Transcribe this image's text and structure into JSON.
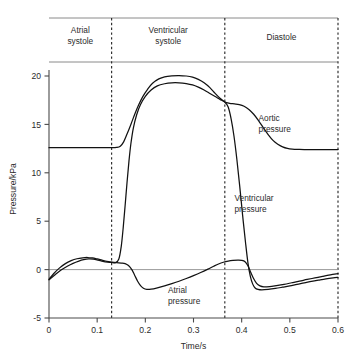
{
  "chart_data": {
    "type": "line",
    "title": "",
    "xlabel": "Time/s",
    "ylabel": "Pressure/kPa",
    "xlim": [
      0,
      0.6
    ],
    "ylim": [
      -5,
      20.5
    ],
    "grid": false,
    "legend_position": "inline-annotations",
    "x_ticks": [
      "0",
      "0.1",
      "0.2",
      "0.3",
      "0.4",
      "0.5",
      "0.6"
    ],
    "x_tick_values": [
      0,
      0.1,
      0.2,
      0.3,
      0.4,
      0.5,
      0.6
    ],
    "y_ticks": [
      "-5",
      "0",
      "5",
      "10",
      "15",
      "20"
    ],
    "y_tick_values": [
      -5,
      0,
      5,
      10,
      15,
      20
    ],
    "phases": [
      {
        "name": "atrial-systole",
        "label": "Atrial\nsystole",
        "label_line1": "Atrial",
        "label_line2": "systole",
        "t_start": 0.0,
        "t_end": 0.13
      },
      {
        "name": "ventricular-systole",
        "label": "Ventricular\nsystole",
        "label_line1": "Ventricular",
        "label_line2": "systole",
        "t_start": 0.13,
        "t_end": 0.365
      },
      {
        "name": "diastole",
        "label": "Diastole",
        "label_line1": "Diastole",
        "label_line2": "",
        "t_start": 0.365,
        "t_end": 0.6
      }
    ],
    "phase_dividers": [
      0.13,
      0.365,
      0.6
    ],
    "annotations": [
      {
        "name": "aortic-pressure-label",
        "line1": "Aortic",
        "line2": "pressure",
        "t": 0.435,
        "p": 15.4
      },
      {
        "name": "ventricular-pressure-label",
        "line1": "Ventricular",
        "line2": "pressure",
        "t": 0.385,
        "p": 7.1
      },
      {
        "name": "atrial-pressure-label",
        "line1": "Atrial",
        "line2": "pressure",
        "t": 0.247,
        "p": -2.4
      }
    ],
    "series": [
      {
        "name": "Aortic pressure",
        "key": "aortic",
        "baseline_kpa": 12.6,
        "peak_kpa": 20.0,
        "incisura_kpa": 17.3,
        "end_kpa": 12.4,
        "points": [
          [
            0.0,
            12.6
          ],
          [
            0.02,
            12.6
          ],
          [
            0.04,
            12.6
          ],
          [
            0.06,
            12.6
          ],
          [
            0.08,
            12.6
          ],
          [
            0.1,
            12.6
          ],
          [
            0.12,
            12.6
          ],
          [
            0.13,
            12.6
          ],
          [
            0.14,
            12.62
          ],
          [
            0.148,
            12.75
          ],
          [
            0.155,
            13.2
          ],
          [
            0.162,
            14.0
          ],
          [
            0.17,
            15.0
          ],
          [
            0.178,
            16.05
          ],
          [
            0.186,
            17.0
          ],
          [
            0.195,
            17.9
          ],
          [
            0.205,
            18.65
          ],
          [
            0.215,
            19.25
          ],
          [
            0.228,
            19.7
          ],
          [
            0.24,
            19.92
          ],
          [
            0.255,
            20.02
          ],
          [
            0.27,
            20.05
          ],
          [
            0.285,
            20.0
          ],
          [
            0.298,
            19.88
          ],
          [
            0.31,
            19.65
          ],
          [
            0.322,
            19.3
          ],
          [
            0.334,
            18.8
          ],
          [
            0.345,
            18.2
          ],
          [
            0.355,
            17.7
          ],
          [
            0.365,
            17.32
          ],
          [
            0.375,
            17.18
          ],
          [
            0.385,
            17.12
          ],
          [
            0.395,
            17.05
          ],
          [
            0.405,
            16.88
          ],
          [
            0.415,
            16.55
          ],
          [
            0.425,
            16.05
          ],
          [
            0.435,
            15.4
          ],
          [
            0.445,
            14.65
          ],
          [
            0.455,
            13.95
          ],
          [
            0.465,
            13.35
          ],
          [
            0.475,
            12.95
          ],
          [
            0.485,
            12.68
          ],
          [
            0.495,
            12.52
          ],
          [
            0.505,
            12.45
          ],
          [
            0.52,
            12.42
          ],
          [
            0.54,
            12.4
          ],
          [
            0.56,
            12.4
          ],
          [
            0.58,
            12.4
          ],
          [
            0.6,
            12.4
          ]
        ]
      },
      {
        "name": "Ventricular pressure",
        "key": "ventricular",
        "peak_kpa": 19.3,
        "min_kpa": -2.1,
        "points": [
          [
            0.0,
            -1.05
          ],
          [
            0.012,
            -0.55
          ],
          [
            0.025,
            -0.05
          ],
          [
            0.038,
            0.35
          ],
          [
            0.05,
            0.65
          ],
          [
            0.062,
            0.88
          ],
          [
            0.072,
            1.02
          ],
          [
            0.082,
            1.1
          ],
          [
            0.092,
            1.08
          ],
          [
            0.102,
            0.98
          ],
          [
            0.112,
            0.86
          ],
          [
            0.122,
            0.78
          ],
          [
            0.13,
            0.74
          ],
          [
            0.138,
            0.72
          ],
          [
            0.145,
            1.1
          ],
          [
            0.15,
            2.4
          ],
          [
            0.154,
            4.3
          ],
          [
            0.158,
            6.6
          ],
          [
            0.162,
            9.0
          ],
          [
            0.166,
            11.2
          ],
          [
            0.17,
            13.0
          ],
          [
            0.175,
            14.6
          ],
          [
            0.182,
            16.0
          ],
          [
            0.19,
            17.05
          ],
          [
            0.2,
            17.9
          ],
          [
            0.212,
            18.55
          ],
          [
            0.225,
            18.98
          ],
          [
            0.24,
            19.2
          ],
          [
            0.255,
            19.3
          ],
          [
            0.27,
            19.3
          ],
          [
            0.285,
            19.22
          ],
          [
            0.298,
            19.08
          ],
          [
            0.31,
            18.85
          ],
          [
            0.322,
            18.55
          ],
          [
            0.334,
            18.2
          ],
          [
            0.345,
            17.88
          ],
          [
            0.355,
            17.58
          ],
          [
            0.365,
            17.3
          ],
          [
            0.372,
            16.8
          ],
          [
            0.378,
            15.6
          ],
          [
            0.384,
            13.8
          ],
          [
            0.39,
            11.4
          ],
          [
            0.396,
            8.6
          ],
          [
            0.402,
            5.6
          ],
          [
            0.408,
            2.8
          ],
          [
            0.413,
            0.7
          ],
          [
            0.418,
            -0.7
          ],
          [
            0.423,
            -1.5
          ],
          [
            0.428,
            -1.9
          ],
          [
            0.434,
            -2.05
          ],
          [
            0.442,
            -2.1
          ],
          [
            0.455,
            -2.05
          ],
          [
            0.47,
            -1.95
          ],
          [
            0.485,
            -1.82
          ],
          [
            0.5,
            -1.68
          ],
          [
            0.515,
            -1.52
          ],
          [
            0.53,
            -1.38
          ],
          [
            0.545,
            -1.22
          ],
          [
            0.56,
            -1.08
          ],
          [
            0.575,
            -0.95
          ],
          [
            0.59,
            -0.85
          ],
          [
            0.6,
            -0.8
          ]
        ]
      },
      {
        "name": "Atrial pressure",
        "key": "atrial",
        "peak_kpa": 1.25,
        "min_kpa": -2.05,
        "points": [
          [
            0.0,
            -1.0
          ],
          [
            0.01,
            -0.4
          ],
          [
            0.022,
            0.18
          ],
          [
            0.034,
            0.62
          ],
          [
            0.046,
            0.92
          ],
          [
            0.058,
            1.12
          ],
          [
            0.07,
            1.22
          ],
          [
            0.08,
            1.25
          ],
          [
            0.09,
            1.2
          ],
          [
            0.1,
            1.1
          ],
          [
            0.11,
            0.98
          ],
          [
            0.12,
            0.86
          ],
          [
            0.13,
            0.78
          ],
          [
            0.14,
            0.72
          ],
          [
            0.15,
            0.68
          ],
          [
            0.158,
            0.62
          ],
          [
            0.165,
            0.42
          ],
          [
            0.172,
            0.0
          ],
          [
            0.178,
            -0.6
          ],
          [
            0.184,
            -1.2
          ],
          [
            0.19,
            -1.65
          ],
          [
            0.196,
            -1.92
          ],
          [
            0.203,
            -2.04
          ],
          [
            0.212,
            -2.02
          ],
          [
            0.225,
            -1.88
          ],
          [
            0.24,
            -1.68
          ],
          [
            0.255,
            -1.45
          ],
          [
            0.27,
            -1.2
          ],
          [
            0.285,
            -0.92
          ],
          [
            0.3,
            -0.62
          ],
          [
            0.315,
            -0.3
          ],
          [
            0.33,
            0.05
          ],
          [
            0.342,
            0.35
          ],
          [
            0.352,
            0.58
          ],
          [
            0.362,
            0.76
          ],
          [
            0.372,
            0.88
          ],
          [
            0.382,
            0.95
          ],
          [
            0.392,
            0.98
          ],
          [
            0.4,
            0.96
          ],
          [
            0.407,
            0.82
          ],
          [
            0.413,
            0.4
          ],
          [
            0.419,
            -0.3
          ],
          [
            0.425,
            -0.95
          ],
          [
            0.431,
            -1.42
          ],
          [
            0.438,
            -1.68
          ],
          [
            0.446,
            -1.78
          ],
          [
            0.458,
            -1.75
          ],
          [
            0.472,
            -1.65
          ],
          [
            0.488,
            -1.52
          ],
          [
            0.504,
            -1.36
          ],
          [
            0.52,
            -1.2
          ],
          [
            0.536,
            -1.02
          ],
          [
            0.552,
            -0.86
          ],
          [
            0.568,
            -0.7
          ],
          [
            0.584,
            -0.55
          ],
          [
            0.6,
            -0.42
          ]
        ]
      }
    ]
  },
  "layout": {
    "plot_left_px": 49,
    "plot_right_px": 338,
    "y_top_px": 76,
    "y_top_value": 20,
    "y_bottom_px": 318,
    "y_bottom_value": -5,
    "band_top_px": 18,
    "band_bottom_px": 62
  }
}
